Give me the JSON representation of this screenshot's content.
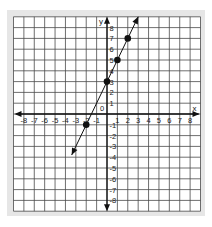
{
  "chart_data": {
    "type": "line",
    "title": "",
    "xlabel": "x",
    "ylabel": "y",
    "origin_label": "0",
    "xlim": [
      -9,
      9
    ],
    "ylim": [
      -9,
      9
    ],
    "grid": true,
    "legend": null,
    "x_ticks": [
      -8,
      -7,
      -6,
      -5,
      -4,
      -3,
      -2,
      -1,
      1,
      2,
      3,
      4,
      5,
      6,
      7,
      8
    ],
    "y_ticks": [
      8,
      7,
      6,
      5,
      4,
      3,
      2,
      1,
      -1,
      -2,
      -3,
      -4,
      -5,
      -6,
      -7,
      -8
    ],
    "series": [
      {
        "name": "y = 2x + 3",
        "equation": {
          "slope": 2,
          "intercept": 3
        },
        "line_extent": {
          "x_start": -3.4,
          "y_start": -3.8,
          "x_end": 3.0,
          "y_end": 9.0
        },
        "arrows_both_ends": true,
        "points": [
          {
            "x": -2,
            "y": -1
          },
          {
            "x": 0,
            "y": 3
          },
          {
            "x": 1,
            "y": 5
          },
          {
            "x": 2,
            "y": 7
          }
        ]
      }
    ]
  },
  "colors": {
    "frame": "#e6e6e6",
    "grid_bg": "#ffffff",
    "grid_line": "#4a4a4a",
    "axis": "#111111",
    "point": "#111111",
    "label": "#222222"
  }
}
